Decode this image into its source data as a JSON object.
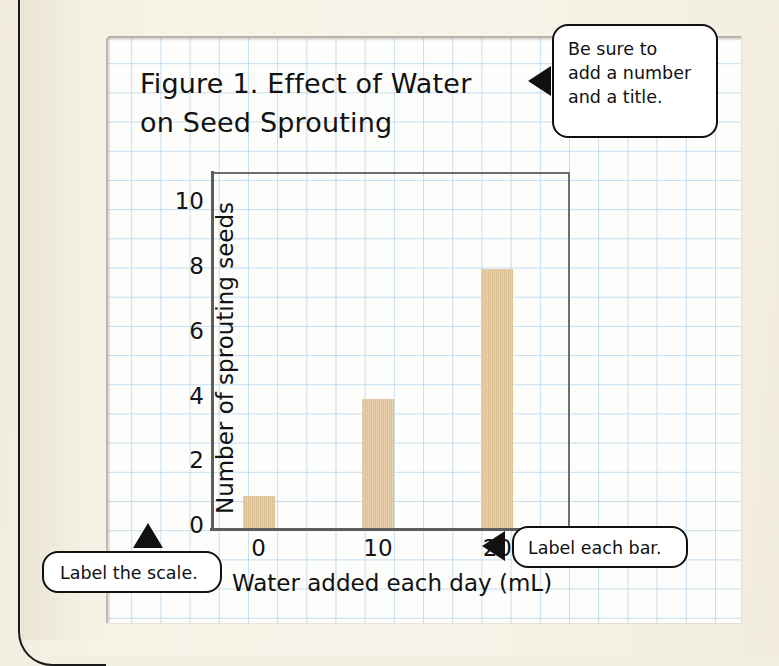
{
  "page": {
    "background_color": "#f3efe2",
    "paper_color": "#fdfdfb",
    "grid_color": "#96c3e4"
  },
  "chart_data": {
    "type": "bar",
    "title": "Figure 1. Effect of Water on Seed Sprouting",
    "title_line1": "Figure 1. Effect of Water",
    "title_line2": "on Seed Sprouting",
    "categories": [
      "0",
      "10",
      "20"
    ],
    "values": [
      1,
      4,
      8
    ],
    "xlabel": "Water added each day (mL)",
    "ylabel": "Number of sprouting seeds",
    "ylim": [
      0,
      11
    ],
    "yticks": [
      "10",
      "8",
      "6",
      "4",
      "2",
      "0"
    ],
    "ytick_values": [
      10,
      8,
      6,
      4,
      2,
      0
    ],
    "bar_color": "#e2c79b",
    "axis_color": "#5d5d5d",
    "grid": true,
    "legend": false
  },
  "callouts": [
    {
      "id": "title-callout",
      "text": "Be sure to add a number and a title.",
      "line1": "Be sure to",
      "line2": "add a number",
      "line3": "and a title.",
      "pointer": "left"
    },
    {
      "id": "bar-callout",
      "text": "Label each bar.",
      "pointer": "left"
    },
    {
      "id": "scale-callout",
      "text": "Label the scale.",
      "pointer": "up"
    }
  ]
}
